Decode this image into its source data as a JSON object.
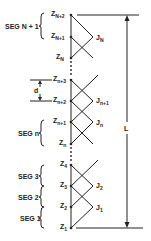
{
  "diagram": {
    "type": "segmented-line-with-junctions",
    "length_label": "L",
    "spacing_label": "d",
    "nodes": [
      {
        "main": "Z",
        "sub": "N+2",
        "y": 15
      },
      {
        "main": "Z",
        "sub": "N+1",
        "y": 37
      },
      {
        "main": "Z",
        "sub": "N",
        "y": 58
      },
      {
        "main": "Z",
        "sub": "n+3",
        "y": 80
      },
      {
        "main": "Z",
        "sub": "n+2",
        "y": 101
      },
      {
        "main": "Z",
        "sub": "n+1",
        "y": 122
      },
      {
        "main": "Z",
        "sub": "n",
        "y": 144
      },
      {
        "main": "Z",
        "sub": "4",
        "y": 165
      },
      {
        "main": "Z",
        "sub": "3",
        "y": 186
      },
      {
        "main": "Z",
        "sub": "2",
        "y": 207
      },
      {
        "main": "Z",
        "sub": "1",
        "y": 228
      }
    ],
    "junctions": [
      {
        "main": "J",
        "sub": "N"
      },
      {
        "main": "J",
        "sub": "n+1"
      },
      {
        "main": "J",
        "sub": "n"
      },
      {
        "main": "J",
        "sub": "2"
      },
      {
        "main": "J",
        "sub": "1"
      }
    ],
    "segments": [
      {
        "label": "SEG N + 1"
      },
      {
        "label": "SEG n"
      },
      {
        "label": "SEG 3"
      },
      {
        "label": "SEG 2"
      },
      {
        "label": "SEG 1"
      }
    ]
  }
}
